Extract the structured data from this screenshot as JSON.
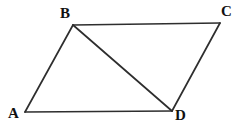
{
  "figure": {
    "name": "parallelogram-abcd-with-diagonal",
    "background_color": "#ffffff",
    "line_color": "#2e2e2e",
    "label_color": "#111111",
    "width": 246,
    "height": 133,
    "vertices": [
      {
        "id": "A",
        "label": "A",
        "x": 25,
        "y": 112,
        "label_x": 8,
        "label_y": 106
      },
      {
        "id": "B",
        "label": "B",
        "x": 73,
        "y": 25,
        "label_x": 60,
        "label_y": 6
      },
      {
        "id": "C",
        "label": "C",
        "x": 220,
        "y": 23,
        "label_x": 221,
        "label_y": 4
      },
      {
        "id": "D",
        "label": "D",
        "x": 172,
        "y": 111,
        "label_x": 175,
        "label_y": 108
      }
    ],
    "edges": [
      {
        "id": "AB",
        "from": "A",
        "to": "B",
        "kind": "side"
      },
      {
        "id": "BC",
        "from": "B",
        "to": "C",
        "kind": "side"
      },
      {
        "id": "CD",
        "from": "C",
        "to": "D",
        "kind": "side"
      },
      {
        "id": "DA",
        "from": "D",
        "to": "A",
        "kind": "side"
      },
      {
        "id": "BD",
        "from": "B",
        "to": "D",
        "kind": "diagonal"
      }
    ],
    "labels": {
      "a": "A",
      "b": "B",
      "c": "C",
      "d": "D"
    }
  }
}
